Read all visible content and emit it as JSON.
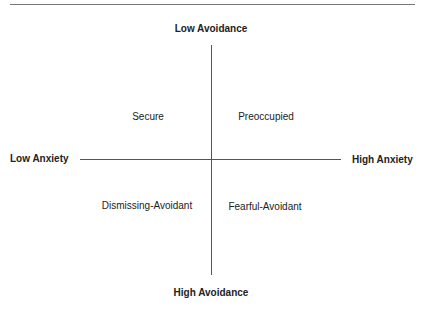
{
  "diagram": {
    "axes": {
      "top": "Low Avoidance",
      "bottom": "High Avoidance",
      "left": "Low Anxiety",
      "right": "High Anxiety"
    },
    "quadrants": {
      "top_left": "Secure",
      "top_right": "Preoccupied",
      "bottom_left": "Dismissing-Avoidant",
      "bottom_right": "Fearful-Avoidant"
    }
  }
}
